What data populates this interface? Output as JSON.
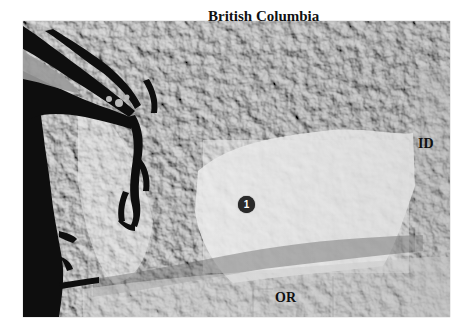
{
  "map": {
    "type": "shaded-relief",
    "region": "Washington State",
    "colors": {
      "water": "#0e0e0e",
      "lowland": "#e8e8e8",
      "mountain_light": "#d0d0d0",
      "mountain_dark": "#7a7a7a",
      "marker": "#2a2a2a"
    },
    "labels": {
      "north": "British Columbia",
      "east": "ID",
      "south": "OR"
    },
    "markers": [
      {
        "id": "1",
        "label": "1"
      }
    ]
  }
}
